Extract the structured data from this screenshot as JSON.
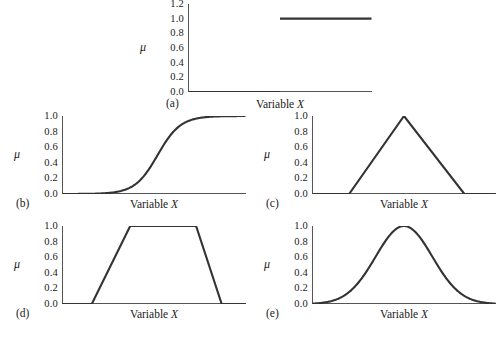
{
  "figure": {
    "background_color": "#ffffff",
    "line_color": "#333333",
    "axis_color": "#555555",
    "axis_x_title": "Variable ",
    "axis_x_title_var": "X",
    "axis_y_symbol": "μ"
  },
  "panels": [
    {
      "id": "a",
      "letter": "(a)",
      "xlabel_prefix": "Variable ",
      "xlabel_var": "X",
      "ylabel": "μ",
      "yticks": [
        "1.2",
        "1.0",
        "0.8",
        "0.6",
        "0.4",
        "0.2",
        "0.0"
      ]
    },
    {
      "id": "b",
      "letter": "(b)",
      "xlabel_prefix": "Variable ",
      "xlabel_var": "X",
      "ylabel": "μ",
      "yticks": [
        "1.0",
        "0.8",
        "0.6",
        "0.4",
        "0.2",
        "0.0"
      ]
    },
    {
      "id": "c",
      "letter": "(c)",
      "xlabel_prefix": "Variable ",
      "xlabel_var": "X",
      "ylabel": "μ",
      "yticks": [
        "1.0",
        "0.8",
        "0.6",
        "0.4",
        "0.2",
        "0.0"
      ]
    },
    {
      "id": "d",
      "letter": "(d)",
      "xlabel_prefix": "Variable ",
      "xlabel_var": "X",
      "ylabel": "μ",
      "yticks": [
        "1.0",
        "0.8",
        "0.6",
        "0.4",
        "0.2",
        "0.0"
      ]
    },
    {
      "id": "e",
      "letter": "(e)",
      "xlabel_prefix": "Variable ",
      "xlabel_var": "X",
      "ylabel": "μ",
      "yticks": [
        "1.0",
        "0.8",
        "0.6",
        "0.4",
        "0.2",
        "0.0"
      ]
    }
  ],
  "chart_data": [
    {
      "type": "line",
      "id": "a",
      "title": "(a) Crisp / step membership function",
      "xlabel": "Variable X",
      "ylabel": "μ",
      "xlim": [
        0,
        1
      ],
      "ylim": [
        0,
        1.2
      ],
      "ytick_values": [
        0.0,
        0.2,
        0.4,
        0.6,
        0.8,
        1.0,
        1.2
      ],
      "ytick_labels": [
        "0.0",
        "0.2",
        "0.4",
        "0.6",
        "0.8",
        "1.0",
        "1.2"
      ],
      "xticks_labeled": false,
      "grid": false,
      "legend": false,
      "segments": [
        {
          "x": [
            0.0,
            0.5
          ],
          "y": [
            0.0,
            0.0
          ]
        },
        {
          "x": [
            0.5,
            1.0
          ],
          "y": [
            1.0,
            1.0
          ]
        }
      ],
      "x": [
        0.0,
        0.5,
        0.5,
        1.0
      ],
      "y": [
        0.0,
        0.0,
        1.0,
        1.0
      ]
    },
    {
      "type": "line",
      "id": "b",
      "title": "(b) Sigmoidal membership function",
      "xlabel": "Variable X",
      "ylabel": "μ",
      "xlim": [
        0,
        1
      ],
      "ylim": [
        0,
        1.0
      ],
      "ytick_values": [
        0.0,
        0.2,
        0.4,
        0.6,
        0.8,
        1.0
      ],
      "ytick_labels": [
        "0.0",
        "0.2",
        "0.4",
        "0.6",
        "0.8",
        "1.0"
      ],
      "xticks_labeled": false,
      "grid": false,
      "legend": false,
      "function": "logistic",
      "params": {
        "center": 0.52,
        "steepness": 16
      },
      "x": [
        0.0,
        0.05,
        0.1,
        0.15,
        0.2,
        0.25,
        0.3,
        0.35,
        0.4,
        0.45,
        0.5,
        0.55,
        0.6,
        0.65,
        0.7,
        0.75,
        0.8,
        0.85,
        0.9,
        0.95,
        1.0
      ],
      "y": [
        0.0,
        0.0,
        0.0,
        0.01,
        0.01,
        0.02,
        0.03,
        0.06,
        0.12,
        0.23,
        0.42,
        0.62,
        0.79,
        0.89,
        0.95,
        0.98,
        0.99,
        1.0,
        1.0,
        1.0,
        1.0
      ]
    },
    {
      "type": "line",
      "id": "c",
      "title": "(c) Triangular membership function",
      "xlabel": "Variable X",
      "ylabel": "μ",
      "xlim": [
        0,
        1
      ],
      "ylim": [
        0,
        1.0
      ],
      "ytick_values": [
        0.0,
        0.2,
        0.4,
        0.6,
        0.8,
        1.0
      ],
      "ytick_labels": [
        "0.0",
        "0.2",
        "0.4",
        "0.6",
        "0.8",
        "1.0"
      ],
      "xticks_labeled": false,
      "grid": false,
      "legend": false,
      "breakpoints": [
        0.0,
        0.2,
        0.5,
        0.83,
        1.0
      ],
      "x": [
        0.0,
        0.2,
        0.5,
        0.83,
        1.0
      ],
      "y": [
        0.0,
        0.0,
        1.0,
        0.0,
        0.0
      ]
    },
    {
      "type": "line",
      "id": "d",
      "title": "(d) Trapezoidal membership function",
      "xlabel": "Variable X",
      "ylabel": "μ",
      "xlim": [
        0,
        1
      ],
      "ylim": [
        0,
        1.0
      ],
      "ytick_values": [
        0.0,
        0.2,
        0.4,
        0.6,
        0.8,
        1.0
      ],
      "ytick_labels": [
        "0.0",
        "0.2",
        "0.4",
        "0.6",
        "0.8",
        "1.0"
      ],
      "xticks_labeled": false,
      "grid": false,
      "legend": false,
      "breakpoints": [
        0.0,
        0.16,
        0.37,
        0.73,
        0.87,
        1.0
      ],
      "x": [
        0.0,
        0.16,
        0.37,
        0.73,
        0.87,
        1.0
      ],
      "y": [
        0.0,
        0.0,
        1.0,
        1.0,
        0.0,
        0.0
      ]
    },
    {
      "type": "line",
      "id": "e",
      "title": "(e) Gaussian membership function",
      "xlabel": "Variable X",
      "ylabel": "μ",
      "xlim": [
        0,
        1
      ],
      "ylim": [
        0,
        1.0
      ],
      "ytick_values": [
        0.0,
        0.2,
        0.4,
        0.6,
        0.8,
        1.0
      ],
      "ytick_labels": [
        "0.0",
        "0.2",
        "0.4",
        "0.6",
        "0.8",
        "1.0"
      ],
      "xticks_labeled": false,
      "grid": false,
      "legend": false,
      "function": "gaussian",
      "params": {
        "mean": 0.5,
        "sigma": 0.155
      },
      "x": [
        0.0,
        0.05,
        0.1,
        0.15,
        0.2,
        0.25,
        0.3,
        0.35,
        0.4,
        0.45,
        0.5,
        0.55,
        0.6,
        0.65,
        0.7,
        0.75,
        0.8,
        0.85,
        0.9,
        0.95,
        1.0
      ],
      "y": [
        0.01,
        0.01,
        0.02,
        0.05,
        0.1,
        0.19,
        0.32,
        0.49,
        0.67,
        0.85,
        1.0,
        0.85,
        0.67,
        0.49,
        0.32,
        0.19,
        0.1,
        0.05,
        0.02,
        0.01,
        0.01
      ]
    }
  ]
}
